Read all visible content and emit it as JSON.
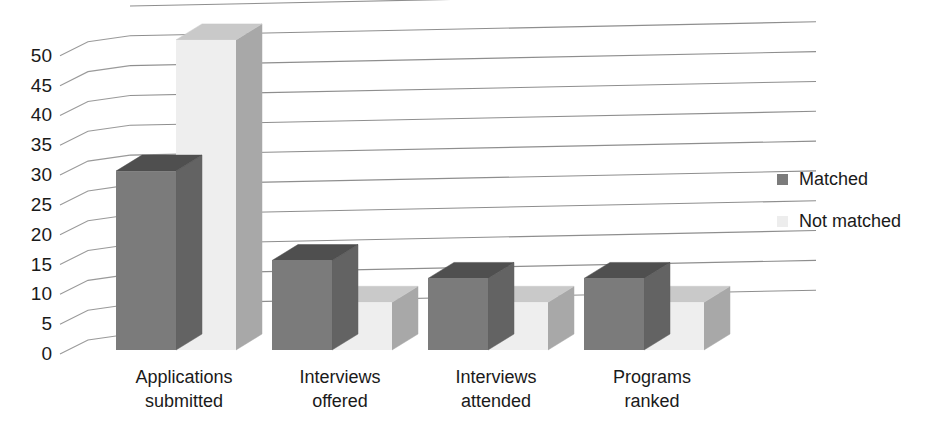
{
  "chart_data": {
    "type": "bar",
    "title": "",
    "subtitle": "",
    "xlabel": "",
    "ylabel": "",
    "categories": [
      "Applications submitted",
      "Interviews offered",
      "Interviews attended",
      "Programs ranked"
    ],
    "category_lines": [
      [
        "Applications",
        "submitted"
      ],
      [
        "Interviews",
        "offered"
      ],
      [
        "Interviews",
        "attended"
      ],
      [
        "Programs",
        "ranked"
      ]
    ],
    "series": [
      {
        "name": "Matched",
        "color": "#7b7b7b",
        "values": [
          30,
          15,
          12,
          12
        ]
      },
      {
        "name": "Not matched",
        "color": "#eeeeee",
        "values": [
          52,
          8,
          8,
          8
        ]
      }
    ],
    "ylim": [
      0,
      55
    ],
    "yticks": [
      0,
      5,
      10,
      15,
      20,
      25,
      30,
      35,
      40,
      45,
      50
    ],
    "ytick_labels": [
      "0",
      "5",
      "10",
      "15",
      "20",
      "25",
      "30",
      "35",
      "40",
      "45",
      "50"
    ],
    "grid": true,
    "legend_position": "right",
    "three_d": true
  },
  "legend": {
    "items": [
      {
        "label": "Matched",
        "swatch_color": "#7b7b7b"
      },
      {
        "label": "Not matched",
        "swatch_color": "#ededed"
      }
    ]
  },
  "colors": {
    "matched_front": "#7b7b7b",
    "matched_side": "#636363",
    "matched_top": "#4f4f4f",
    "not_matched_front": "#eeeeee",
    "not_matched_side": "#a8a8a8",
    "not_matched_top": "#c9c9c9",
    "gridline": "#8e8e8e",
    "text": "#1a1a1a",
    "background": "#ffffff"
  }
}
